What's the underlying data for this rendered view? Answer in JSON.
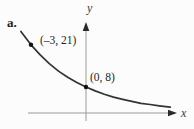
{
  "figure_label": "a.",
  "colors": {
    "curve": "#333333",
    "axis": "#999999",
    "arrow": "#2a2a2a",
    "point": "#111111",
    "text": "#1f1f1f"
  },
  "chart_data": {
    "type": "line",
    "title": "",
    "xlabel": "x",
    "ylabel": "y",
    "grid": false,
    "legend": false,
    "xlim": [
      -3.6,
      5.9
    ],
    "ylim": [
      0,
      27.5
    ],
    "curve_description": "Decreasing exponential curve falling from upper left through (-3, 21) and (0, 8), approaching the x-axis asymptotically to the right",
    "labeled_points": [
      {
        "x": -3,
        "y": 21,
        "label": "(–3, 21)"
      },
      {
        "x": 0,
        "y": 8,
        "label": "(0, 8)"
      }
    ],
    "curve_points": [
      [
        -3.55,
        25.1
      ],
      [
        -3.0,
        21.0
      ],
      [
        -2.5,
        17.9
      ],
      [
        -2.0,
        15.2
      ],
      [
        -1.5,
        12.9
      ],
      [
        -1.0,
        11.0
      ],
      [
        -0.5,
        9.4
      ],
      [
        0.0,
        8.0
      ],
      [
        0.5,
        6.8
      ],
      [
        1.0,
        5.8
      ],
      [
        1.5,
        4.9
      ],
      [
        2.0,
        4.2
      ],
      [
        2.5,
        3.6
      ],
      [
        3.0,
        3.0
      ],
      [
        3.5,
        2.6
      ],
      [
        4.0,
        2.2
      ],
      [
        4.6,
        1.8
      ]
    ]
  }
}
